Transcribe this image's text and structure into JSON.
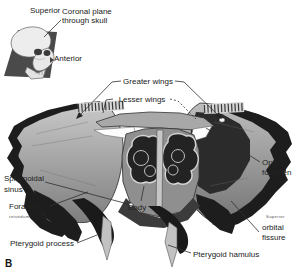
{
  "figure": {
    "panel_letter": "B",
    "inset": {
      "superior": "Superior",
      "anterior": "Anterior",
      "coronal_line1": "Coronal plane",
      "coronal_line2": "through skull"
    },
    "labels": {
      "greater_wings": "Greater wings",
      "lesser_wings": "Lesser wings",
      "sphenoidal_sinus_1": "Sphenoidal",
      "sphenoidal_sinus_2": "sinus",
      "foramen": "Foramen",
      "foramen_2": "rotundum",
      "pterygoid_process": "Pterygoid process",
      "body": "Body",
      "pterygoid_hamulus": "Pterygoid hamulus",
      "optic_foramen_1": "Optic",
      "optic_foramen_2": "foramen",
      "superior_orbital_fissure_1": "Superior",
      "superior_orbital_fissure_2": "orbital",
      "superior_orbital_fissure_3": "fissure"
    },
    "colors": {
      "background": "#ffffff",
      "bone_light": "#c6c6c6",
      "bone_mid": "#8f8f8f",
      "bone_dark": "#1d1d1d",
      "cavity_dark": "#232323",
      "text": "#222222"
    }
  }
}
